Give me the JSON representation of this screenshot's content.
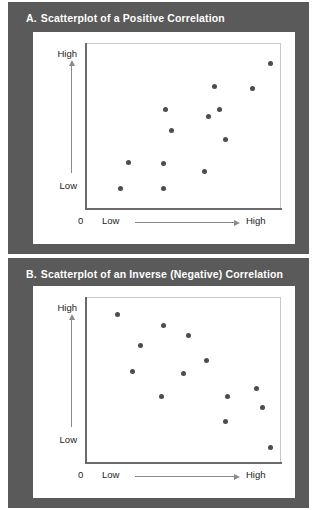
{
  "figure": {
    "background_color": "#5a5a5a",
    "card_color": "#ffffff",
    "dot_color": "#4c4c51",
    "title_color": "#ffffff"
  },
  "panels": [
    {
      "letter": "A.",
      "title": "Scatterplot of a Positive Correlation",
      "y_axis": {
        "high_label": "High",
        "low_label": "Low",
        "arrow": "up-arrow-icon"
      },
      "x_axis": {
        "origin_label": "0",
        "low_label": "Low",
        "high_label": "High",
        "arrow": "right-arrow-icon"
      }
    },
    {
      "letter": "B.",
      "title": "Scatterplot of an Inverse (Negative) Correlation",
      "y_axis": {
        "high_label": "High",
        "low_label": "Low",
        "arrow": "up-arrow-icon"
      },
      "x_axis": {
        "origin_label": "0",
        "low_label": "Low",
        "high_label": "High",
        "arrow": "right-arrow-icon"
      }
    }
  ],
  "chart_data": [
    {
      "type": "scatter",
      "title": "A. Scatterplot of a Positive Correlation",
      "xlabel": "Low to High",
      "ylabel": "Low to High",
      "xlim": [
        0,
        100
      ],
      "ylim": [
        0,
        100
      ],
      "grid": false,
      "legend": null,
      "relationship": "positive",
      "points": [
        {
          "x": 18,
          "y": 12
        },
        {
          "x": 40,
          "y": 12
        },
        {
          "x": 22,
          "y": 28
        },
        {
          "x": 40,
          "y": 27
        },
        {
          "x": 61,
          "y": 22
        },
        {
          "x": 44,
          "y": 47
        },
        {
          "x": 72,
          "y": 42
        },
        {
          "x": 41,
          "y": 60
        },
        {
          "x": 63,
          "y": 56
        },
        {
          "x": 69,
          "y": 60
        },
        {
          "x": 66,
          "y": 74
        },
        {
          "x": 86,
          "y": 73
        },
        {
          "x": 95,
          "y": 88
        }
      ]
    },
    {
      "type": "scatter",
      "title": "B. Scatterplot of an Inverse (Negative) Correlation",
      "xlabel": "Low to High",
      "ylabel": "Low to High",
      "xlim": [
        0,
        100
      ],
      "ylim": [
        0,
        100
      ],
      "grid": false,
      "legend": null,
      "relationship": "negative",
      "points": [
        {
          "x": 16,
          "y": 90
        },
        {
          "x": 40,
          "y": 83
        },
        {
          "x": 53,
          "y": 77
        },
        {
          "x": 28,
          "y": 71
        },
        {
          "x": 24,
          "y": 55
        },
        {
          "x": 50,
          "y": 54
        },
        {
          "x": 62,
          "y": 62
        },
        {
          "x": 39,
          "y": 40
        },
        {
          "x": 73,
          "y": 40
        },
        {
          "x": 88,
          "y": 45
        },
        {
          "x": 91,
          "y": 33
        },
        {
          "x": 72,
          "y": 25
        },
        {
          "x": 95,
          "y": 9
        }
      ]
    }
  ]
}
